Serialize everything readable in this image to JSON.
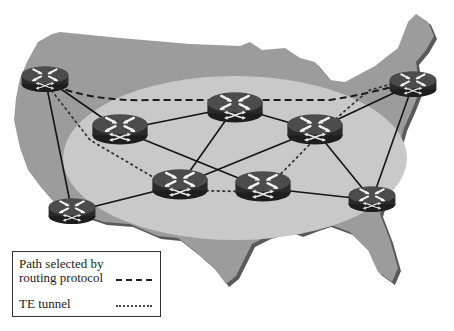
{
  "diagram": {
    "colors": {
      "map_fill": "#9a9a9a",
      "map_shadow": "#5a5a5a",
      "oval_fill": "#c8c8c8",
      "router_top": "#4a4a4a",
      "router_side": "#2a2a2a",
      "link": "#111111"
    },
    "routers": [
      {
        "id": "R1",
        "x": 45,
        "y": 78,
        "size": "small"
      },
      {
        "id": "R2",
        "x": 120,
        "y": 130,
        "size": "large"
      },
      {
        "id": "R3",
        "x": 235,
        "y": 107,
        "size": "large"
      },
      {
        "id": "R4",
        "x": 315,
        "y": 130,
        "size": "large"
      },
      {
        "id": "R5",
        "x": 413,
        "y": 84,
        "size": "small"
      },
      {
        "id": "R6",
        "x": 72,
        "y": 212,
        "size": "small"
      },
      {
        "id": "R7",
        "x": 180,
        "y": 185,
        "size": "large"
      },
      {
        "id": "R8",
        "x": 263,
        "y": 188,
        "size": "large"
      },
      {
        "id": "R9",
        "x": 372,
        "y": 200,
        "size": "small"
      }
    ],
    "links": [
      [
        "R1",
        "R2"
      ],
      [
        "R1",
        "R6"
      ],
      [
        "R2",
        "R3"
      ],
      [
        "R2",
        "R8"
      ],
      [
        "R3",
        "R4"
      ],
      [
        "R3",
        "R7"
      ],
      [
        "R4",
        "R7"
      ],
      [
        "R4",
        "R5"
      ],
      [
        "R4",
        "R9"
      ],
      [
        "R5",
        "R9"
      ],
      [
        "R6",
        "R7"
      ],
      [
        "R8",
        "R9"
      ]
    ],
    "routing_protocol_path": [
      "R1",
      "R3",
      "R5"
    ],
    "te_tunnel_path": [
      "R1",
      "R7",
      "R8",
      "R4",
      "R5"
    ]
  },
  "legend": {
    "routing_label": "Path selected by routing protocol",
    "te_label": "TE tunnel"
  }
}
